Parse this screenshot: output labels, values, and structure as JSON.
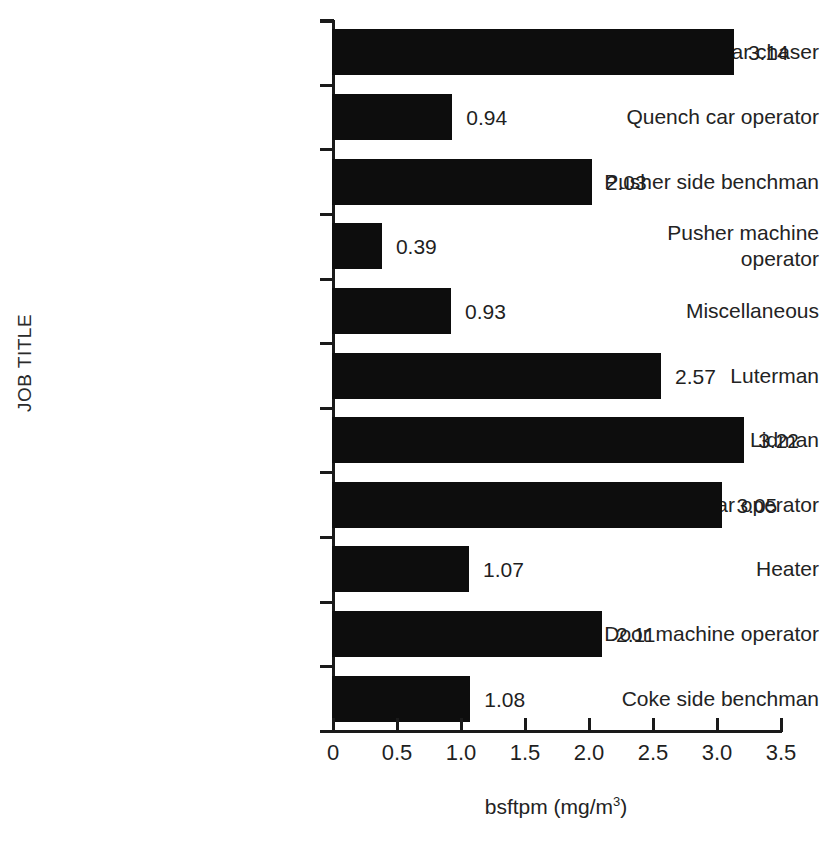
{
  "chart_data": {
    "type": "bar",
    "orientation": "horizontal",
    "title": "",
    "xlabel": "bsftpm (mg/m3)",
    "xlabel_base": "bsftpm (mg/m",
    "xlabel_sup": "3",
    "xlabel_tail": ")",
    "ylabel": "JOB TITLE",
    "categories": [
      "Tar chaser",
      "Quench car operator",
      "Pusher side benchman",
      "Pusher machine operator",
      "Miscellaneous",
      "Luterman",
      "Lidman",
      "Larry car operator",
      "Heater",
      "Door machine operator",
      "Coke side benchman"
    ],
    "values": [
      3.14,
      0.94,
      2.03,
      0.39,
      0.93,
      2.57,
      3.22,
      3.05,
      1.07,
      2.11,
      1.08
    ],
    "value_labels": [
      "3.14",
      "0.94",
      "2.03",
      "0.39",
      "0.93",
      "2.57",
      "3.22",
      "3.05",
      "1.07",
      "2.11",
      "1.08"
    ],
    "xlim": [
      0,
      3.5
    ],
    "xticks": [
      0,
      0.5,
      1.0,
      1.5,
      2.0,
      2.5,
      3.0,
      3.5
    ],
    "xtick_labels": [
      "0",
      "0.5",
      "1.0",
      "1.5",
      "2.0",
      "2.5",
      "3.0",
      "3.5"
    ],
    "grid": false,
    "legend": false,
    "bar_color": "#0d0d0d",
    "axis_color": "#1a1a1a",
    "background": "#ffffff"
  }
}
